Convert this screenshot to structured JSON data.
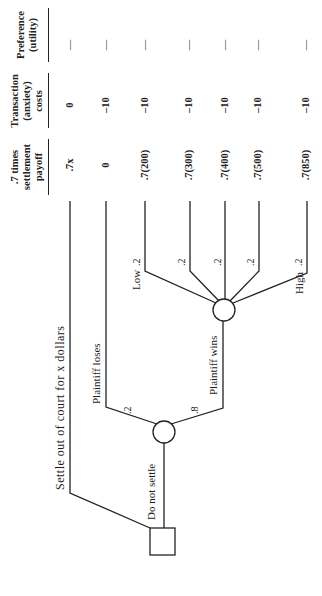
{
  "diagram": {
    "type": "decision-tree",
    "orientation": "rotated-90-ccw",
    "nodes": {
      "decision": {
        "shape": "square"
      },
      "chance_trial": {
        "shape": "circle"
      },
      "chance_award": {
        "shape": "circle"
      }
    },
    "branches": {
      "settle": "Settle out of court for x dollars",
      "do_not_settle": "Do not settle",
      "plaintiff_loses": "Plaintiff loses",
      "plaintiff_wins": "Plaintiff wins",
      "low": "Low",
      "high": "High"
    },
    "probabilities": {
      "loses": ".2",
      "wins": ".8",
      "award": [
        ".2",
        ".2",
        ".2",
        ".2",
        ".2"
      ]
    },
    "columns": [
      {
        "header_lines": [
          ".7 times",
          "settlement",
          "payoff"
        ]
      },
      {
        "header_lines": [
          "Transaction",
          "(anxiety)",
          "costs"
        ]
      },
      {
        "header_lines": [
          "Preference",
          "(utility)"
        ]
      }
    ],
    "rows": [
      {
        "payoff": ".7x",
        "cost": "0",
        "utility": "—"
      },
      {
        "payoff": "0",
        "cost": "–10",
        "utility": "—"
      },
      {
        "payoff": ".7(200)",
        "cost": "–10",
        "utility": "—"
      },
      {
        "payoff": ".7(300)",
        "cost": "–10",
        "utility": "—"
      },
      {
        "payoff": ".7(400)",
        "cost": "–10",
        "utility": "—"
      },
      {
        "payoff": ".7(500)",
        "cost": "–10",
        "utility": "—"
      },
      {
        "payoff": ".7(850)",
        "cost": "–10",
        "utility": "—"
      }
    ]
  }
}
